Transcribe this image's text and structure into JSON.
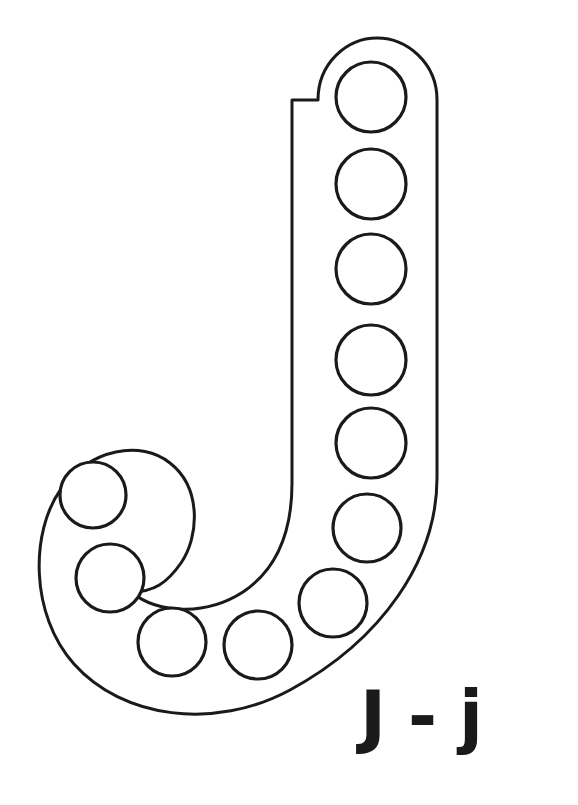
{
  "page": {
    "background_color": "#ffffff",
    "width": 578,
    "height": 805
  },
  "worksheet": {
    "letter": "J",
    "letter_uppercase": "J",
    "letter_lowercase": "j",
    "label_text": "J - j",
    "label_parts": {
      "uppercase": "J",
      "separator": "-",
      "lowercase": "j"
    },
    "outline_color": "#1a1a1a",
    "fill_color": "#ffffff",
    "stroke_width": 3,
    "dot_count": 11,
    "dot_radius": 34,
    "dots": [
      {
        "id": "dot-1",
        "cx": 371,
        "cy": 97,
        "r": 35
      },
      {
        "id": "dot-2",
        "cx": 371,
        "cy": 184,
        "r": 35
      },
      {
        "id": "dot-3",
        "cx": 371,
        "cy": 269,
        "r": 35
      },
      {
        "id": "dot-4",
        "cx": 371,
        "cy": 360,
        "r": 35
      },
      {
        "id": "dot-5",
        "cx": 371,
        "cy": 443,
        "r": 35
      },
      {
        "id": "dot-6",
        "cx": 367,
        "cy": 528,
        "r": 34
      },
      {
        "id": "dot-7",
        "cx": 333,
        "cy": 603,
        "r": 34
      },
      {
        "id": "dot-8",
        "cx": 258,
        "cy": 645,
        "r": 34
      },
      {
        "id": "dot-9",
        "cx": 172,
        "cy": 642,
        "r": 34
      },
      {
        "id": "dot-10",
        "cx": 110,
        "cy": 578,
        "r": 34
      },
      {
        "id": "dot-11",
        "cx": 93,
        "cy": 495,
        "r": 33
      }
    ],
    "outline_path": "M 318 100 C 318 63 347 38 377 38 C 407 38 437 63 437 100 L 437 478 C 437 560 382 640 290 690 C 214 731 122 718 74 664 C 30 615 30 532 61 489 C 91 448 141 440 170 463 C 202 488 199 537 181 563 C 167 583 154 592 131 592 C 161 616 209 614 243 592 C 276 570 292 534 292 483 L 292 100 Z"
  }
}
